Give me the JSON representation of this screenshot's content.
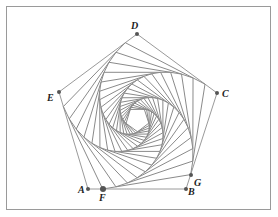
{
  "diagram": {
    "line_color": "#8a8a8a",
    "outer_color": "#9a9a9a",
    "point_color": "#555555",
    "pentagon": {
      "vertices": [
        {
          "name": "A",
          "x": 88,
          "y": 189,
          "label_x": 78,
          "label_y": 193
        },
        {
          "name": "B",
          "x": 186,
          "y": 189,
          "label_x": 188,
          "label_y": 195
        },
        {
          "name": "C",
          "x": 217,
          "y": 93,
          "label_x": 222,
          "label_y": 97
        },
        {
          "name": "D",
          "x": 137,
          "y": 34,
          "label_x": 131,
          "label_y": 29
        },
        {
          "name": "E",
          "x": 59,
          "y": 92,
          "label_x": 47,
          "label_y": 101
        }
      ]
    },
    "extra_points": [
      {
        "name": "F",
        "x": 103,
        "y": 189,
        "label_x": 99,
        "label_y": 201,
        "big": true
      },
      {
        "name": "G",
        "x": 191,
        "y": 175,
        "label_x": 194,
        "label_y": 186,
        "big": false
      }
    ],
    "step_fraction": 0.15,
    "iterations": 20
  }
}
